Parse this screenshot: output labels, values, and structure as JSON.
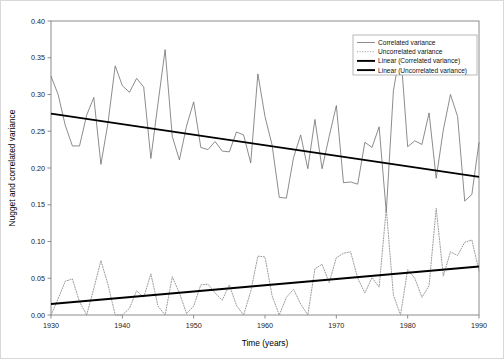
{
  "chart_data": {
    "type": "line",
    "title": "",
    "xlabel": "Time (years)",
    "ylabel": "Nugget and correlated variance",
    "xlim": [
      1930,
      1990
    ],
    "ylim": [
      0.0,
      0.4
    ],
    "grid": false,
    "legend_position": "top-right",
    "xticks": [
      1930,
      1940,
      1950,
      1960,
      1970,
      1980,
      1990
    ],
    "xticklabels": [
      "1930",
      "1940",
      "1950",
      "1960",
      "1970",
      "1980",
      "1990"
    ],
    "yticks": [
      0.0,
      0.05,
      0.1,
      0.15,
      0.2,
      0.25,
      0.3,
      0.35,
      0.4
    ],
    "yticklabels": [
      "0.00",
      "0.05",
      "0.10",
      "0.15",
      "0.20",
      "0.25",
      "0.30",
      "0.35",
      "0.40"
    ],
    "x": [
      1930,
      1931,
      1932,
      1933,
      1934,
      1935,
      1936,
      1937,
      1938,
      1939,
      1940,
      1941,
      1942,
      1943,
      1944,
      1945,
      1946,
      1947,
      1948,
      1949,
      1950,
      1951,
      1952,
      1953,
      1954,
      1955,
      1956,
      1957,
      1958,
      1959,
      1960,
      1961,
      1962,
      1963,
      1964,
      1965,
      1966,
      1967,
      1968,
      1969,
      1970,
      1971,
      1972,
      1973,
      1974,
      1975,
      1976,
      1977,
      1978,
      1979,
      1980,
      1981,
      1982,
      1983,
      1984,
      1985,
      1986,
      1987,
      1988,
      1989,
      1990
    ],
    "series": [
      {
        "name": "Correlated variance",
        "style": "solid-thin",
        "color": "#6e6e6e",
        "values": [
          0.325,
          0.3,
          0.258,
          0.23,
          0.23,
          0.272,
          0.296,
          0.205,
          0.262,
          0.339,
          0.312,
          0.303,
          0.322,
          0.31,
          0.213,
          0.288,
          0.361,
          0.243,
          0.211,
          0.257,
          0.29,
          0.228,
          0.225,
          0.236,
          0.223,
          0.222,
          0.249,
          0.245,
          0.207,
          0.328,
          0.27,
          0.231,
          0.16,
          0.159,
          0.214,
          0.245,
          0.199,
          0.266,
          0.199,
          0.243,
          0.285,
          0.18,
          0.181,
          0.178,
          0.235,
          0.228,
          0.256,
          0.14,
          0.305,
          0.361,
          0.229,
          0.237,
          0.232,
          0.275,
          0.186,
          0.252,
          0.3,
          0.27,
          0.155,
          0.164,
          0.235
        ]
      },
      {
        "name": "Uncorrelated variance",
        "style": "dotted",
        "color": "#909090",
        "values": [
          0.0,
          0.022,
          0.046,
          0.049,
          0.018,
          0.0,
          0.036,
          0.074,
          0.041,
          0.0,
          0.0,
          0.009,
          0.033,
          0.024,
          0.056,
          0.012,
          0.0,
          0.052,
          0.03,
          0.002,
          0.012,
          0.041,
          0.042,
          0.03,
          0.02,
          0.041,
          0.013,
          0.0,
          0.032,
          0.08,
          0.079,
          0.026,
          0.0,
          0.024,
          0.035,
          0.015,
          0.0,
          0.063,
          0.069,
          0.044,
          0.078,
          0.084,
          0.086,
          0.05,
          0.03,
          0.051,
          0.038,
          0.145,
          0.027,
          0.0,
          0.062,
          0.05,
          0.024,
          0.04,
          0.145,
          0.053,
          0.086,
          0.081,
          0.099,
          0.102,
          0.06
        ]
      }
    ],
    "trendlines": [
      {
        "name": "Linear (Correlated variance)",
        "style": "solid-thick",
        "color": "#000000",
        "x": [
          1930,
          1990
        ],
        "y": [
          0.274,
          0.188
        ]
      },
      {
        "name": "Linear (Uncorrelated variance)",
        "style": "solid-thick",
        "color": "#000000",
        "x": [
          1930,
          1990
        ],
        "y": [
          0.015,
          0.066
        ]
      }
    ],
    "legend": [
      {
        "label": "Correlated variance",
        "style": "solid-thin"
      },
      {
        "label": "Uncorrelated variance",
        "style": "dotted"
      },
      {
        "label": "Linear (Correlated variance)",
        "style": "solid-thick"
      },
      {
        "label": "Linear (Uncorrelated variance)",
        "style": "solid-thick"
      }
    ]
  }
}
